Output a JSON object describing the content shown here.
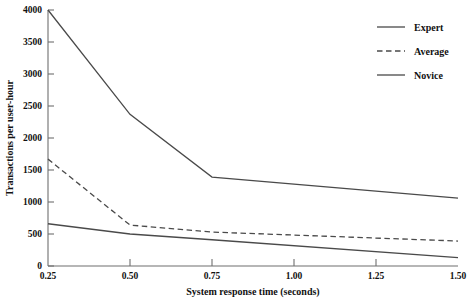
{
  "chart_data": {
    "type": "line",
    "title": "",
    "xlabel": "System response time (seconds)",
    "ylabel": "Transactions per user-hour",
    "x": [
      0.25,
      0.5,
      0.75,
      1.0,
      1.25,
      1.5
    ],
    "xlim": [
      0.25,
      1.5
    ],
    "ylim": [
      0,
      4000
    ],
    "xticks": [
      "0.25",
      "0.50",
      "0.75",
      "1.00",
      "1.25",
      "1.50"
    ],
    "yticks": [
      "0",
      "500",
      "1000",
      "1500",
      "2000",
      "2500",
      "3000",
      "3500",
      "4000"
    ],
    "grid": false,
    "legend_position": "top-right",
    "series": [
      {
        "name": "Expert",
        "style": "solid",
        "x": [
          0.25,
          0.5,
          0.75,
          1.5
        ],
        "values": [
          4000,
          2370,
          1390,
          1060
        ]
      },
      {
        "name": "Average",
        "style": "dashed",
        "x": [
          0.25,
          0.5,
          0.75,
          1.5
        ],
        "values": [
          1670,
          640,
          530,
          390
        ]
      },
      {
        "name": "Novice",
        "style": "solid",
        "x": [
          0.25,
          0.5,
          0.75,
          1.5
        ],
        "values": [
          660,
          500,
          410,
          130
        ]
      }
    ]
  },
  "axes": {
    "y_title": "Transactions per user-hour",
    "x_title": "System response time (seconds)",
    "y_tick_labels": [
      "4000",
      "3500",
      "3000",
      "2500",
      "2000",
      "1500",
      "1000",
      "500",
      "0"
    ],
    "x_tick_labels": [
      "0.25",
      "0.50",
      "0.75",
      "1.00",
      "1.25",
      "1.50"
    ]
  },
  "legend": {
    "items": [
      {
        "label": "Expert",
        "style": "solid"
      },
      {
        "label": "Average",
        "style": "dashed"
      },
      {
        "label": "Novice",
        "style": "solid"
      }
    ]
  },
  "colors": {
    "line": "#4a4a4a",
    "axis": "#6f6f6f",
    "text": "#111111",
    "background": "#ffffff"
  }
}
